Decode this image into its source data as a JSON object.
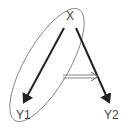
{
  "nodes": {
    "x": {
      "label": "X"
    },
    "y1": {
      "label": "Y1"
    },
    "y2": {
      "label": "Y2"
    }
  },
  "edges": [
    {
      "from": "X",
      "to": "Y1",
      "style": "thick-arrow"
    },
    {
      "from": "X",
      "to": "Y2",
      "style": "thick-arrow"
    },
    {
      "from": "ellipse(X,Y1)",
      "to": "edge(X,Y2)",
      "style": "double-line-arrow"
    }
  ],
  "grouping": {
    "members": [
      "X",
      "Y1"
    ],
    "shape": "ellipse"
  },
  "colors": {
    "line": "#222222",
    "ellipse": "#777777",
    "text": "#444444"
  }
}
